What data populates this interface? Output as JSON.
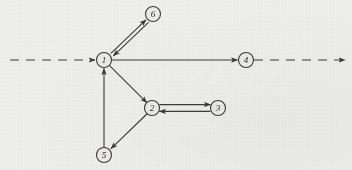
{
  "diagram": {
    "type": "directed-graph",
    "canvas": {
      "width": 352,
      "height": 170
    },
    "style": {
      "background_color": "#eeeeec",
      "stroke_color": "#3a3a3a",
      "node_fill": "#ecebe9",
      "label_color": "#2e2e2e",
      "node_radius": 7.5,
      "stroke_width": 1.1
    },
    "nodes": [
      {
        "id": "1",
        "label": "1",
        "cx": 104,
        "cy": 60
      },
      {
        "id": "2",
        "label": "2",
        "cx": 152,
        "cy": 108
      },
      {
        "id": "3",
        "label": "3",
        "cx": 218,
        "cy": 108
      },
      {
        "id": "4",
        "label": "4",
        "cx": 246,
        "cy": 60
      },
      {
        "id": "5",
        "label": "5",
        "cx": 104,
        "cy": 155
      },
      {
        "id": "6",
        "label": "6",
        "cx": 153,
        "cy": 14
      }
    ],
    "edges": [
      {
        "id": "e-axis-in",
        "from": "axis-left-start",
        "to": "1",
        "style": "dashed",
        "arrow": "end",
        "label": ""
      },
      {
        "id": "e-1-4",
        "from": "1",
        "to": "4",
        "style": "solid",
        "arrow": "end",
        "label": ""
      },
      {
        "id": "e-axis-out",
        "from": "4",
        "to": "axis-right-end",
        "style": "dashed",
        "arrow": "end",
        "label": ""
      },
      {
        "id": "e-1-6",
        "from": "1",
        "to": "6",
        "style": "solid",
        "arrow": "end",
        "label": ""
      },
      {
        "id": "e-6-1",
        "from": "6",
        "to": "1",
        "style": "solid",
        "arrow": "end",
        "label": ""
      },
      {
        "id": "e-1-2",
        "from": "1",
        "to": "2",
        "style": "solid",
        "arrow": "end",
        "label": ""
      },
      {
        "id": "e-2-3",
        "from": "2",
        "to": "3",
        "style": "solid",
        "arrow": "end",
        "label": ""
      },
      {
        "id": "e-3-2",
        "from": "3",
        "to": "2",
        "style": "solid",
        "arrow": "end",
        "label": ""
      },
      {
        "id": "e-2-5",
        "from": "2",
        "to": "5",
        "style": "solid",
        "arrow": "end",
        "label": ""
      },
      {
        "id": "e-5-1",
        "from": "5",
        "to": "1",
        "style": "solid",
        "arrow": "end",
        "label": ""
      }
    ],
    "axis": {
      "left_start_x": 10,
      "right_end_x": 345,
      "y": 60,
      "dash_pattern": "9 7"
    }
  }
}
